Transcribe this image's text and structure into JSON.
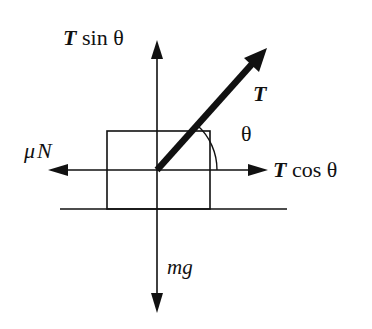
{
  "diagram": {
    "colors": {
      "stroke": "#111111",
      "background": "#ffffff"
    },
    "labels": {
      "t_sin_symbol": "T",
      "t_sin_rest": " sin θ",
      "t_symbol": "T",
      "theta": "θ",
      "mu_n_mu": "μ",
      "mu_n_n": "N",
      "t_cos_symbol": "T",
      "t_cos_rest": " cos θ",
      "mg": "mg"
    },
    "forces": [
      {
        "name": "tension",
        "label": "T",
        "direction": "up-right"
      },
      {
        "name": "vertical-component",
        "label": "T sin θ",
        "direction": "up"
      },
      {
        "name": "horizontal-component",
        "label": "T cos θ",
        "direction": "right"
      },
      {
        "name": "friction",
        "label": "μN",
        "direction": "left"
      },
      {
        "name": "weight",
        "label": "mg",
        "direction": "down"
      }
    ]
  }
}
